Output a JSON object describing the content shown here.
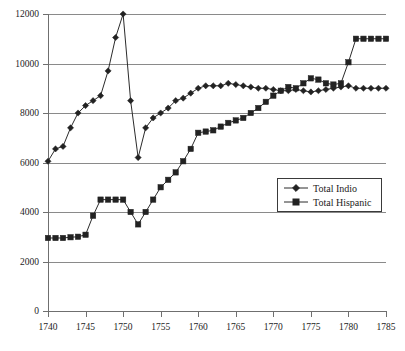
{
  "chart_data": {
    "type": "line",
    "title": "",
    "subtitle": "",
    "xlabel": "",
    "ylabel": "",
    "xlim": [
      1740,
      1785
    ],
    "ylim": [
      0,
      12000
    ],
    "xticks": [
      1740,
      1745,
      1750,
      1755,
      1760,
      1765,
      1770,
      1775,
      1780,
      1785
    ],
    "yticks": [
      0,
      2000,
      4000,
      6000,
      8000,
      10000,
      12000
    ],
    "xtick_labels": [
      "1740",
      "1745",
      "1750",
      "1755",
      "1760",
      "1765",
      "1770",
      "1775",
      "1780",
      "1785"
    ],
    "ytick_labels": [
      "0",
      "2000",
      "4000",
      "6000",
      "8000",
      "10000",
      "12000"
    ],
    "grid": "horizontal",
    "legend_position": "inside-lower-right",
    "x": [
      1740,
      1741,
      1742,
      1743,
      1744,
      1745,
      1746,
      1747,
      1748,
      1749,
      1750,
      1751,
      1752,
      1753,
      1754,
      1755,
      1756,
      1757,
      1758,
      1759,
      1760,
      1761,
      1762,
      1763,
      1764,
      1765,
      1766,
      1767,
      1768,
      1769,
      1770,
      1771,
      1772,
      1773,
      1774,
      1775,
      1776,
      1777,
      1778,
      1779,
      1780,
      1781,
      1782,
      1783,
      1784,
      1785
    ],
    "series": [
      {
        "name": "Total Indio",
        "marker": "diamond",
        "color": "#222222",
        "values": [
          6050,
          6550,
          6650,
          7400,
          8000,
          8300,
          8500,
          8700,
          9700,
          11050,
          12000,
          8500,
          6200,
          7400,
          7800,
          8000,
          8200,
          8500,
          8600,
          8800,
          9000,
          9100,
          9100,
          9100,
          9200,
          9150,
          9100,
          9050,
          9000,
          9000,
          8950,
          8900,
          8900,
          8950,
          8900,
          8850,
          8900,
          8950,
          9000,
          9050,
          9100,
          9000,
          9000,
          9000,
          9000,
          9000
        ]
      },
      {
        "name": "Total Hispanic",
        "marker": "square",
        "color": "#222222",
        "values": [
          2950,
          2950,
          2950,
          2980,
          3000,
          3080,
          3850,
          4500,
          4500,
          4500,
          4500,
          4000,
          3500,
          4000,
          4500,
          5000,
          5300,
          5600,
          6050,
          6550,
          7200,
          7250,
          7300,
          7450,
          7600,
          7700,
          7800,
          8000,
          8200,
          8450,
          8700,
          8900,
          9050,
          9000,
          9200,
          9400,
          9350,
          9200,
          9150,
          9200,
          10050,
          11000,
          11000,
          11000,
          11000,
          11000
        ]
      }
    ]
  },
  "legend": {
    "entries": [
      {
        "label": "Total Indio",
        "marker": "diamond"
      },
      {
        "label": "Total Hispanic",
        "marker": "square"
      }
    ]
  }
}
